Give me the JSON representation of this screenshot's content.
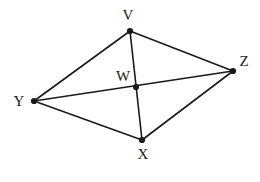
{
  "figure": {
    "kind": "geometry-diagram",
    "background_color": "#ffffff",
    "stroke_color": "#1a1a1a",
    "label_color": "#1a1a1a",
    "stroke_width": 1.6,
    "dot_radius": 3.1,
    "width": 260,
    "height": 182,
    "vertices": [
      {
        "id": "V",
        "label": "V",
        "x": 130,
        "y": 31,
        "label_x": 128,
        "label_y": 15
      },
      {
        "id": "Z",
        "label": "Z",
        "x": 233,
        "y": 71,
        "label_x": 244,
        "label_y": 61
      },
      {
        "id": "W",
        "label": "W",
        "x": 136,
        "y": 87,
        "label_x": 123,
        "label_y": 76
      },
      {
        "id": "Y",
        "label": "Y",
        "x": 34,
        "y": 101,
        "label_x": 19,
        "label_y": 101
      },
      {
        "id": "X",
        "label": "X",
        "x": 142,
        "y": 140,
        "label_x": 143,
        "label_y": 154
      }
    ],
    "edges": [
      {
        "id": "edge-V-Y",
        "from": "V",
        "to": "Y"
      },
      {
        "id": "edge-V-Z",
        "from": "V",
        "to": "Z"
      },
      {
        "id": "edge-V-X",
        "from": "V",
        "to": "X"
      },
      {
        "id": "edge-Y-Z",
        "from": "Y",
        "to": "Z"
      },
      {
        "id": "edge-Y-X",
        "from": "Y",
        "to": "X"
      },
      {
        "id": "edge-X-Z",
        "from": "X",
        "to": "Z"
      }
    ]
  }
}
